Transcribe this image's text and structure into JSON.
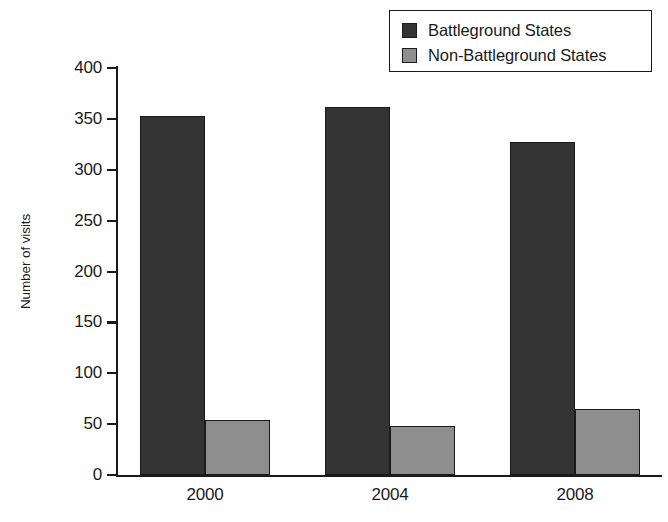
{
  "chart_data": {
    "type": "bar",
    "title": "",
    "xlabel": "",
    "ylabel": "Number of visits",
    "categories": [
      "2000",
      "2004",
      "2008"
    ],
    "series": [
      {
        "name": "Battleground States",
        "color": "#333333",
        "values": [
          353,
          362,
          327
        ]
      },
      {
        "name": "Non-Battleground States",
        "color": "#8e8e8e",
        "values": [
          54,
          48,
          65
        ]
      }
    ],
    "ylim": [
      0,
      400
    ],
    "ytick_step": 50,
    "yticks": [
      "0",
      "50",
      "100",
      "150",
      "200",
      "250",
      "300",
      "350",
      "400"
    ],
    "grid": false,
    "legend_position": "top-right"
  },
  "legend": {
    "items": [
      {
        "label": "Battleground States",
        "color": "#333333"
      },
      {
        "label": "Non-Battleground States",
        "color": "#8e8e8e"
      }
    ]
  },
  "axes": {
    "y_title": "Number of visits"
  }
}
